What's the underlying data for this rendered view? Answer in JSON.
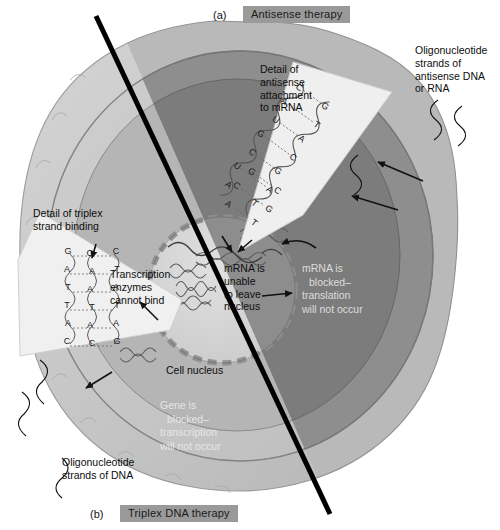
{
  "figure": {
    "panel_a": {
      "letter": "(a)",
      "title": "Antisense therapy"
    },
    "panel_b": {
      "letter": "(b)",
      "title": "Triplex DNA therapy"
    }
  },
  "labels": {
    "oligo_antisense": "Oligonucleotide\nstrands of\nantisense DNA\nor RNA",
    "oligo_antisense_lines": [
      "Oligonucleotide",
      "strands of",
      "antisense DNA",
      "or RNA"
    ],
    "detail_antisense_lines": [
      "Detail of",
      "antisense",
      "attachment",
      "to mRNA"
    ],
    "detail_triplex_lines": [
      "Detail of triplex",
      "strand binding"
    ],
    "transcription_lines": [
      "Transcription",
      "enzymes",
      "cannot bind"
    ],
    "mrna_unable_lines": [
      "mRNA is",
      "unable",
      "to leave",
      "nucleus"
    ],
    "mrna_blocked_lines": [
      "mRNA is",
      "blocked–",
      "translation",
      "will not occur"
    ],
    "gene_blocked_lines": [
      "Gene is",
      "blocked–",
      "transcription",
      "will not occur"
    ],
    "cell_nucleus": "Cell nucleus",
    "oligo_dna_lines": [
      "Oligonucleotide",
      "strands of DNA"
    ]
  },
  "diagram_data": {
    "type": "biology-illustration",
    "subject": "Gene therapy: antisense vs triplex DNA",
    "antisense_duplex": {
      "description": "mRNA strand base-paired with antisense oligonucleotide",
      "top_strand": [
        "C",
        "A",
        "U",
        "G",
        "C",
        "U",
        "A",
        "G",
        "C",
        "G",
        "A",
        "U"
      ],
      "bottom_strand": [
        "G",
        "T",
        "A",
        "C",
        "G",
        "A",
        "T",
        "C",
        "G",
        "C",
        "T",
        "A"
      ],
      "pairs": [
        "C-G",
        "A-T",
        "U-A",
        "G-C",
        "C-G",
        "U-A",
        "A-T",
        "G-C",
        "C-G",
        "G-C",
        "A-T",
        "U-A"
      ]
    },
    "triplex_binding": {
      "description": "Third oligonucleotide strand bound in the major groove of duplex DNA",
      "triplets": [
        [
          "G",
          "G",
          "C"
        ],
        [
          "A",
          "A",
          "T"
        ],
        [
          "T",
          "A",
          "A"
        ],
        [
          "T",
          "T",
          "T"
        ],
        [
          "A",
          "A",
          "A"
        ],
        [
          "C",
          "C",
          "G"
        ]
      ]
    },
    "structures": [
      "cell membrane",
      "cytoplasm",
      "cell nucleus",
      "mRNA strands",
      "DNA"
    ]
  },
  "colors": {
    "title_badge_bg": "#9a9a9a",
    "cell_outer_light": "#c8c8c8",
    "cell_outer_dark": "#8e8e8e",
    "cytoplasm_light": "#c2c2c2",
    "cytoplasm_dark": "#7f7f7f",
    "nucleus_light": "#d7d7d7",
    "nucleus_dark": "#8a8a8a",
    "inset_fill": "#efefef",
    "divider": "#000000"
  }
}
